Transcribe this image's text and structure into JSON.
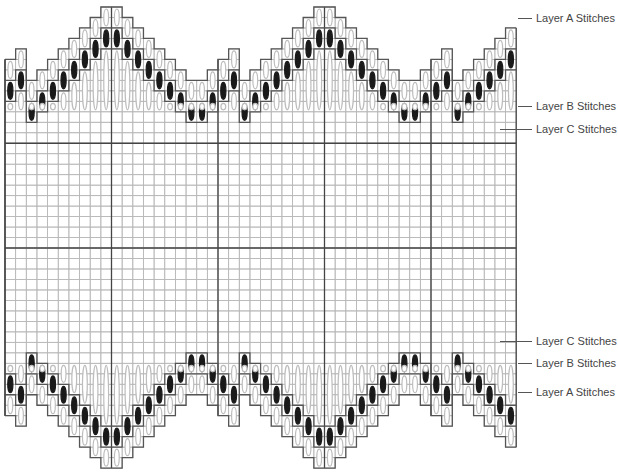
{
  "diagram": {
    "type": "stitch-chart",
    "grid": {
      "cols": 48,
      "rows": 44,
      "left": 5,
      "top": 7,
      "cell_w": 10.65,
      "cell_h": 10.48,
      "thick_every": 10,
      "thick_rows": [
        13,
        23
      ],
      "colors": {
        "fine": "#b8b8b8",
        "thick": "#444444",
        "outline": "#555555",
        "stitch_light": "#bdbdbd",
        "stitch_dark": "#1a1a1a"
      }
    },
    "motif_period": 20,
    "motif_profile_top": [
      7,
      6,
      5,
      4,
      3,
      2,
      1,
      0,
      0,
      1,
      2,
      3,
      4,
      5,
      6,
      7,
      7,
      6,
      5,
      4
    ],
    "motif_offset": -2
  },
  "labels": {
    "top": [
      {
        "text": "Layer A Stitches",
        "x": 536,
        "y": 12
      },
      {
        "text": "Layer B Stitches",
        "x": 536,
        "y": 100
      },
      {
        "text": "Layer C Stitches",
        "x": 536,
        "y": 123
      }
    ],
    "bottom": [
      {
        "text": "Layer C Stitches",
        "x": 536,
        "y": 335
      },
      {
        "text": "Layer B Stitches",
        "x": 536,
        "y": 357
      },
      {
        "text": "Layer A Stitches",
        "x": 536,
        "y": 386
      }
    ]
  }
}
